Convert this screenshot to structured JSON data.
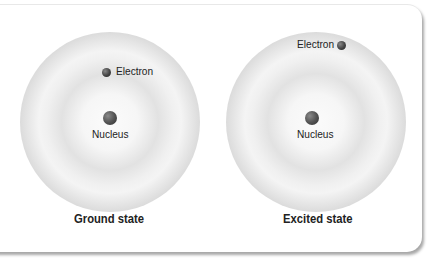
{
  "diagrams": [
    {
      "title": "Ground state",
      "nucleus_label": "Nucleus",
      "electron_label": "Electron"
    },
    {
      "title": "Excited state",
      "nucleus_label": "Nucleus",
      "electron_label": "Electron"
    }
  ]
}
